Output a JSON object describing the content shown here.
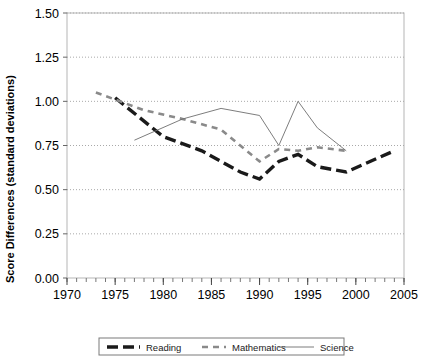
{
  "chart_data": {
    "type": "line",
    "title": "",
    "xlabel": "",
    "ylabel": "Score Differences (standard deviations)",
    "xlim": [
      1970,
      2005
    ],
    "ylim": [
      0.0,
      1.5
    ],
    "x_ticks": [
      1970,
      1975,
      1980,
      1985,
      1990,
      1995,
      2000,
      2005
    ],
    "x_tick_labels": [
      "1970",
      "1975",
      "1980",
      "1985",
      "1990",
      "1995",
      "2000",
      "2005"
    ],
    "x_minor_tick_step": 1,
    "y_ticks": [
      0.0,
      0.25,
      0.5,
      0.75,
      1.0,
      1.25,
      1.5
    ],
    "y_tick_labels": [
      "0.00",
      "0.25",
      "0.50",
      "0.75",
      "1.00",
      "1.25",
      "1.50"
    ],
    "grid": "horizontal-dotted",
    "legend_position": "bottom",
    "series": [
      {
        "name": "Reading",
        "style": "thick-dashed",
        "color": "#1a1a1a",
        "x": [
          1975,
          1980,
          1984,
          1988,
          1990,
          1992,
          1994,
          1996,
          1999,
          2004
        ],
        "y": [
          1.02,
          0.8,
          0.72,
          0.6,
          0.56,
          0.66,
          0.7,
          0.63,
          0.6,
          0.72
        ]
      },
      {
        "name": "Mathematics",
        "style": "medium-dashed",
        "color": "#8a8a8a",
        "x": [
          1973,
          1978,
          1982,
          1986,
          1990,
          1992,
          1994,
          1996,
          1999
        ],
        "y": [
          1.05,
          0.95,
          0.9,
          0.84,
          0.66,
          0.73,
          0.72,
          0.74,
          0.72
        ]
      },
      {
        "name": "Science",
        "style": "thin-solid",
        "color": "#6e6e6e",
        "x": [
          1977,
          1982,
          1986,
          1990,
          1992,
          1994,
          1996,
          1999
        ],
        "y": [
          0.78,
          0.9,
          0.96,
          0.92,
          0.75,
          1.0,
          0.85,
          0.72
        ]
      }
    ],
    "legend": [
      {
        "label": "Reading",
        "style": "thick-dashed",
        "color": "#1a1a1a"
      },
      {
        "label": "Mathematics",
        "style": "medium-dashed",
        "color": "#8a8a8a"
      },
      {
        "label": "Science",
        "style": "thin-solid",
        "color": "#6e6e6e"
      }
    ]
  }
}
